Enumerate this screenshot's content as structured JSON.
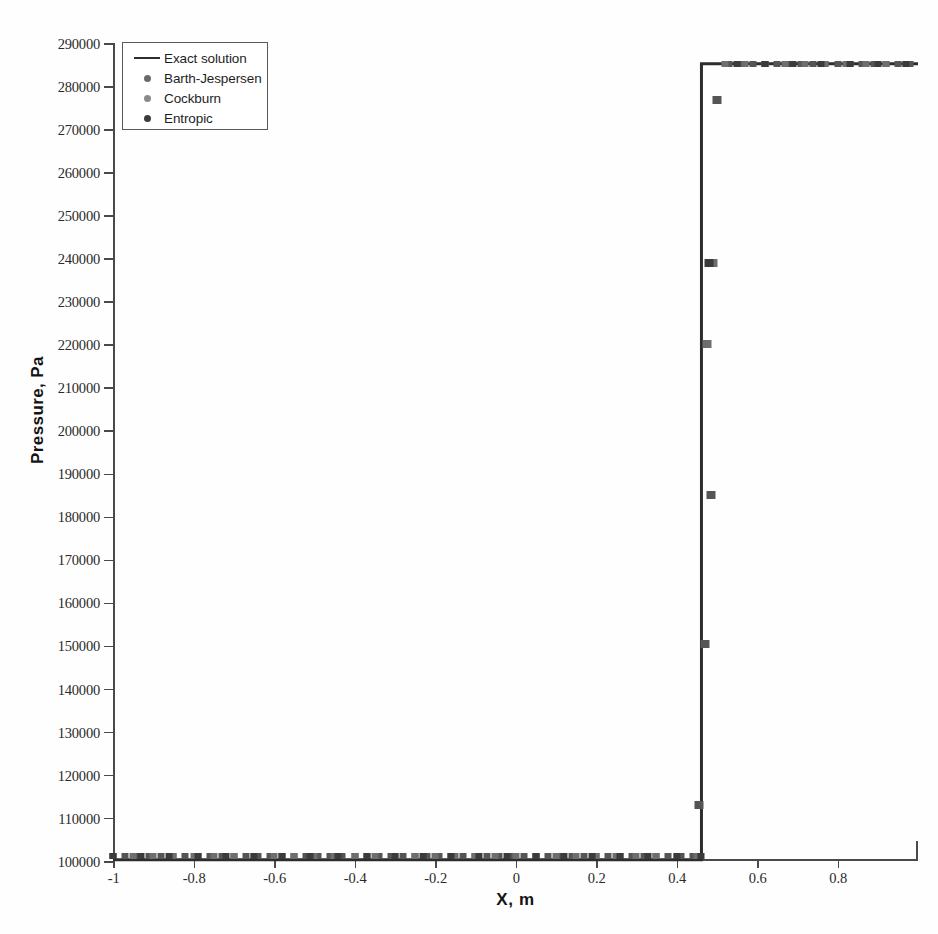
{
  "chart_data": {
    "type": "line",
    "title": "",
    "xlabel": "X, m",
    "ylabel": "Pressure, Pa",
    "xlim": [
      -1,
      1
    ],
    "ylim": [
      100000,
      290000
    ],
    "grid": false,
    "legend_position": "upper-left",
    "xticks": [
      -1,
      -0.8,
      -0.6,
      -0.4,
      -0.2,
      0,
      0.2,
      0.4,
      0.6,
      0.8
    ],
    "xtick_labels": [
      "-1",
      "-0.8",
      "-0.6",
      "-0.4",
      "-0.2",
      "0",
      "0.2",
      "0.4",
      "0.6",
      "0.8"
    ],
    "yticks": [
      100000,
      110000,
      120000,
      130000,
      140000,
      150000,
      160000,
      170000,
      180000,
      190000,
      200000,
      210000,
      220000,
      230000,
      240000,
      250000,
      260000,
      270000,
      280000,
      290000
    ],
    "ytick_labels": [
      "100000",
      "110000",
      "120000",
      "130000",
      "140000",
      "150000",
      "160000",
      "170000",
      "180000",
      "190000",
      "200000",
      "210000",
      "220000",
      "230000",
      "240000",
      "250000",
      "260000",
      "270000",
      "280000",
      "290000"
    ],
    "annotation": "Shock tube pressure profile: left state ~101000 Pa, sharp shock jump near x = 0.47, right plateau ~285000 Pa",
    "series": [
      {
        "name": "Exact solution",
        "type": "line",
        "color": "#2d2d2d",
        "x": [
          -1.0,
          0.462,
          0.462,
          1.0
        ],
        "y": [
          100300,
          100300,
          285200,
          285200
        ]
      },
      {
        "name": "Barth-Jespersen",
        "type": "scatter",
        "marker": "square",
        "color": "#555555",
        "x": [
          -1.0,
          -0.97,
          -0.94,
          -0.91,
          -0.88,
          -0.85,
          -0.82,
          -0.79,
          -0.76,
          -0.73,
          -0.7,
          -0.67,
          -0.64,
          -0.61,
          -0.58,
          -0.55,
          -0.52,
          -0.49,
          -0.46,
          -0.43,
          -0.4,
          -0.37,
          -0.34,
          -0.31,
          -0.28,
          -0.25,
          -0.22,
          -0.19,
          -0.16,
          -0.13,
          -0.1,
          -0.07,
          -0.04,
          -0.01,
          0.02,
          0.05,
          0.08,
          0.11,
          0.14,
          0.17,
          0.2,
          0.23,
          0.26,
          0.29,
          0.32,
          0.35,
          0.38,
          0.41,
          0.44,
          0.455,
          0.47,
          0.485,
          0.5,
          0.53,
          0.56,
          0.59,
          0.62,
          0.65,
          0.68,
          0.71,
          0.74,
          0.77,
          0.8,
          0.83,
          0.86,
          0.89,
          0.92,
          0.95,
          0.98
        ],
        "y": [
          101200,
          101200,
          101200,
          101200,
          101200,
          101200,
          101200,
          101200,
          101200,
          101200,
          101200,
          101200,
          101200,
          101200,
          101200,
          101200,
          101200,
          101200,
          101200,
          101200,
          101200,
          101200,
          101200,
          101200,
          101200,
          101200,
          101200,
          101200,
          101200,
          101200,
          101200,
          101200,
          101200,
          101200,
          101200,
          101200,
          101200,
          101200,
          101200,
          101200,
          101200,
          101200,
          101200,
          101200,
          101200,
          101200,
          101200,
          101200,
          101200,
          113000,
          150500,
          185000,
          276800,
          285200,
          285200,
          285200,
          285200,
          285200,
          285200,
          285200,
          285200,
          285200,
          285200,
          285200,
          285200,
          285200,
          285200,
          285200,
          285200
        ]
      },
      {
        "name": "Cockburn",
        "type": "scatter",
        "marker": "square",
        "color": "#6e6e6e",
        "x": [
          -1.0,
          -0.95,
          -0.9,
          -0.85,
          -0.8,
          -0.75,
          -0.7,
          -0.65,
          -0.6,
          -0.55,
          -0.5,
          -0.45,
          -0.4,
          -0.35,
          -0.3,
          -0.25,
          -0.2,
          -0.15,
          -0.1,
          -0.05,
          0.0,
          0.05,
          0.1,
          0.15,
          0.2,
          0.25,
          0.3,
          0.35,
          0.4,
          0.45,
          0.475,
          0.49,
          0.52,
          0.57,
          0.62,
          0.67,
          0.72,
          0.77,
          0.82,
          0.87,
          0.92,
          0.97
        ],
        "y": [
          101200,
          101200,
          101200,
          101200,
          101200,
          101200,
          101200,
          101200,
          101200,
          101200,
          101200,
          101200,
          101200,
          101200,
          101200,
          101200,
          101200,
          101200,
          101200,
          101200,
          101200,
          101200,
          101200,
          101200,
          101200,
          101200,
          101200,
          101200,
          101200,
          101200,
          220000,
          239000,
          285200,
          285200,
          285200,
          285200,
          285200,
          285200,
          285200,
          285200,
          285200,
          285200
        ]
      },
      {
        "name": "Entropic",
        "type": "scatter",
        "marker": "square",
        "color": "#3b3b3b",
        "x": [
          -1.0,
          -0.93,
          -0.86,
          -0.79,
          -0.72,
          -0.65,
          -0.58,
          -0.51,
          -0.44,
          -0.37,
          -0.3,
          -0.23,
          -0.16,
          -0.09,
          -0.02,
          0.05,
          0.12,
          0.19,
          0.26,
          0.33,
          0.4,
          0.46,
          0.48,
          0.55,
          0.62,
          0.69,
          0.76,
          0.83,
          0.9,
          0.97
        ],
        "y": [
          101200,
          101200,
          101200,
          101200,
          101200,
          101200,
          101200,
          101200,
          101200,
          101200,
          101200,
          101200,
          101200,
          101200,
          101200,
          101200,
          101200,
          101200,
          101200,
          101200,
          101200,
          101200,
          239000,
          285200,
          285200,
          285200,
          285200,
          285200,
          285200,
          285200
        ]
      }
    ]
  },
  "legend": {
    "items": [
      {
        "label": "Exact solution",
        "key": "line",
        "color": "#2d2d2d"
      },
      {
        "label": "Barth-Jespersen",
        "key": "dot",
        "color": "#6a6a6a"
      },
      {
        "label": "Cockburn",
        "key": "dot",
        "color": "#8a8a8a"
      },
      {
        "label": "Entropic",
        "key": "dot",
        "color": "#3b3b3b"
      }
    ]
  }
}
